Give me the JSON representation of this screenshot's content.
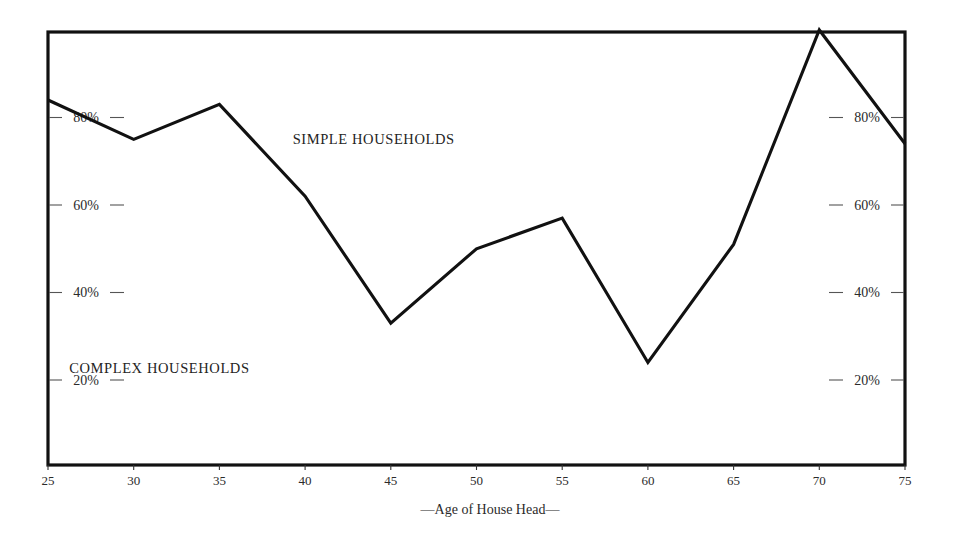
{
  "chart_data": {
    "type": "line",
    "title": "",
    "subtitle": "",
    "xlabel": "—Age of House Head—",
    "ylabel": "",
    "x": [
      25,
      30,
      35,
      40,
      45,
      50,
      55,
      60,
      65,
      70,
      75
    ],
    "xtick_labels": [
      "25",
      "30",
      "35",
      "40",
      "45",
      "50",
      "55",
      "60",
      "65",
      "70",
      "75"
    ],
    "ytick_labels": [
      "20%",
      "40%",
      "60%",
      "80%"
    ],
    "ytick_values": [
      20,
      40,
      60,
      80
    ],
    "xlim": [
      25,
      75
    ],
    "ylim": [
      0,
      100
    ],
    "grid": false,
    "legend": "none",
    "series": [
      {
        "name": "Share simple households",
        "values": [
          84,
          75,
          83,
          62,
          33,
          50,
          57,
          24,
          51,
          100,
          74
        ]
      }
    ],
    "annotations": [
      {
        "text": "SIMPLE HOUSEHOLDS",
        "x": 44.0,
        "y": 74.0,
        "region": "above-curve"
      },
      {
        "text": "COMPLEX HOUSEHOLDS",
        "x": 31.5,
        "y": 21.5,
        "region": "below-curve"
      }
    ]
  },
  "axes": {
    "x_axis_title": "—Age of House Head—",
    "left_ticks": [
      {
        "label": "20%",
        "value": 20
      },
      {
        "label": "40%",
        "value": 40
      },
      {
        "label": "60%",
        "value": 60
      },
      {
        "label": "80%",
        "value": 80
      }
    ],
    "right_ticks": [
      {
        "label": "20%",
        "value": 20
      },
      {
        "label": "40%",
        "value": 40
      },
      {
        "label": "60%",
        "value": 60
      },
      {
        "label": "80%",
        "value": 80
      }
    ],
    "x_ticks": [
      {
        "label": "25",
        "value": 25
      },
      {
        "label": "30",
        "value": 30
      },
      {
        "label": "35",
        "value": 35
      },
      {
        "label": "40",
        "value": 40
      },
      {
        "label": "45",
        "value": 45
      },
      {
        "label": "50",
        "value": 50
      },
      {
        "label": "55",
        "value": 55
      },
      {
        "label": "60",
        "value": 60
      },
      {
        "label": "65",
        "value": 65
      },
      {
        "label": "70",
        "value": 70
      },
      {
        "label": "75",
        "value": 75
      }
    ]
  },
  "style": {
    "line_color": "#111111",
    "frame_color": "#111111",
    "text_color": "#2b2b2b",
    "background_color": "#ffffff"
  }
}
